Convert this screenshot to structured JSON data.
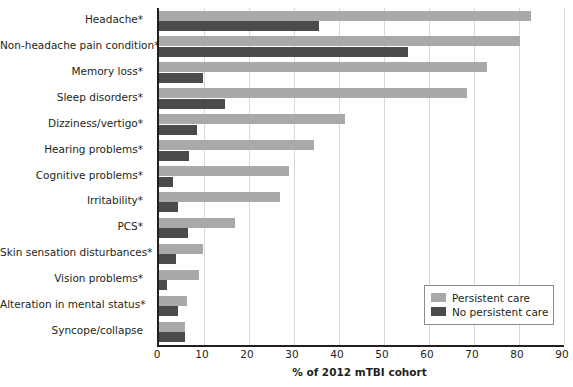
{
  "chart_data": {
    "type": "bar",
    "orientation": "horizontal",
    "title": "",
    "xlabel": "% of 2012 mTBI cohort",
    "ylabel": "",
    "xlim": [
      0,
      90
    ],
    "xticks": [
      0,
      10,
      20,
      30,
      40,
      50,
      60,
      70,
      80,
      90
    ],
    "grid": "vertical",
    "legend_position": "bottom-right",
    "categories": [
      "Headache*",
      "Non-headache pain condition*",
      "Memory loss*",
      "Sleep disorders*",
      "Dizziness/vertigo*",
      "Hearing problems*",
      "Cognitive problems*",
      "Irritability*",
      "PCS*",
      "Skin sensation disturbances*",
      "Vision problems*",
      "Alteration in mental status*",
      "Syncope/collapse"
    ],
    "series": [
      {
        "name": "Persistent care",
        "color": "#a9a9a9",
        "values": [
          82.7,
          80.2,
          72.9,
          68.4,
          41.3,
          34.4,
          28.9,
          26.9,
          16.9,
          9.8,
          8.9,
          6.2,
          5.8
        ]
      },
      {
        "name": "No persistent care",
        "color": "#4b4b4b",
        "values": [
          35.6,
          55.3,
          9.8,
          14.7,
          8.4,
          6.6,
          3.1,
          4.2,
          6.4,
          3.8,
          1.8,
          4.2,
          5.8
        ]
      }
    ]
  },
  "legend": {
    "items": [
      {
        "label": "Persistent care",
        "color": "#a9a9a9"
      },
      {
        "label": "No persistent care",
        "color": "#4b4b4b"
      }
    ]
  }
}
